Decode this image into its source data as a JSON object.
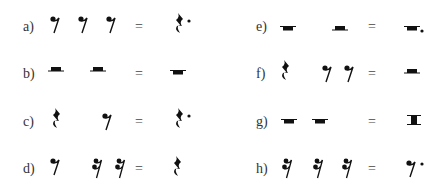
{
  "exercises": [
    {
      "label": "a)",
      "parts": [
        "eighth-rest",
        "eighth-rest",
        "eighth-rest"
      ],
      "equals": "=",
      "result": "dotted-quarter-rest"
    },
    {
      "label": "b)",
      "parts": [
        "half-rest",
        "half-rest"
      ],
      "equals": "=",
      "result": "whole-rest"
    },
    {
      "label": "c)",
      "parts": [
        "quarter-rest",
        "eighth-rest"
      ],
      "equals": "=",
      "result": "dotted-quarter-rest"
    },
    {
      "label": "d)",
      "parts": [
        "eighth-rest",
        "sixteenth-rest",
        "sixteenth-rest"
      ],
      "equals": "=",
      "result": "quarter-rest"
    },
    {
      "label": "e)",
      "parts": [
        "whole-rest",
        "half-rest"
      ],
      "equals": "=",
      "result": "dotted-whole-rest"
    },
    {
      "label": "f)",
      "parts": [
        "quarter-rest",
        "eighth-rest",
        "eighth-rest"
      ],
      "equals": "=",
      "result": "half-rest"
    },
    {
      "label": "g)",
      "parts": [
        "whole-rest",
        "whole-rest"
      ],
      "equals": "=",
      "result": "double-whole-rest"
    },
    {
      "label": "h)",
      "parts": [
        "sixteenth-rest",
        "sixteenth-rest",
        "sixteenth-rest"
      ],
      "equals": "=",
      "result": "dotted-eighth-rest"
    }
  ]
}
